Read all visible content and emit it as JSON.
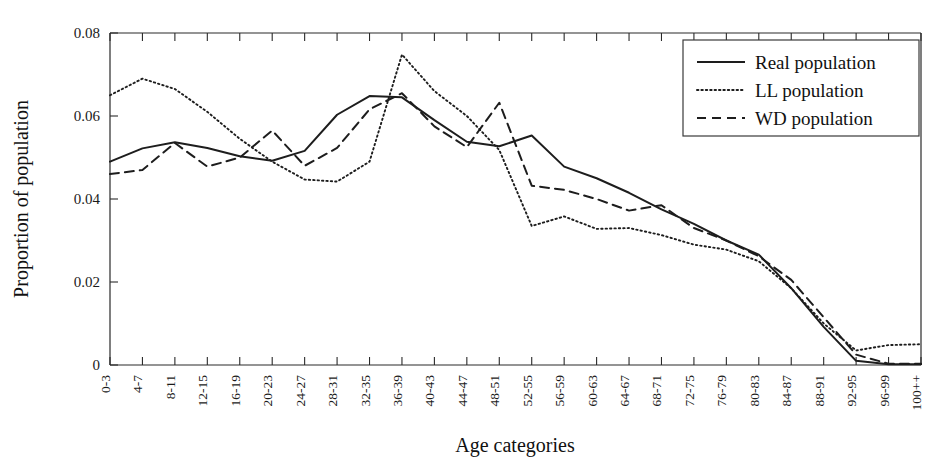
{
  "chart_data": {
    "type": "line",
    "title": "",
    "xlabel": "Age categories",
    "ylabel": "Proportion of population",
    "categories": [
      "0-3",
      "4-7",
      "8-11",
      "12-15",
      "16-19",
      "20-23",
      "24-27",
      "28-31",
      "32-35",
      "36-39",
      "40-43",
      "44-47",
      "48-51",
      "52-55",
      "56-59",
      "60-63",
      "64-67",
      "68-71",
      "72-75",
      "76-79",
      "80-83",
      "84-87",
      "88-91",
      "92-95",
      "96-99",
      "100++"
    ],
    "xlim": [
      0,
      25
    ],
    "ylim": [
      0,
      0.08
    ],
    "yticks": [
      0,
      0.02,
      0.04,
      0.06,
      0.08
    ],
    "ytick_labels": [
      "0",
      "0.02",
      "0.04",
      "0.06",
      "0.08"
    ],
    "grid": false,
    "legend_position": "top-right",
    "series": [
      {
        "name": "Real population",
        "style": "solid",
        "values": [
          0.049,
          0.0522,
          0.0537,
          0.0523,
          0.0503,
          0.0492,
          0.0516,
          0.0603,
          0.0648,
          0.0645,
          0.059,
          0.0538,
          0.0527,
          0.0553,
          0.0478,
          0.045,
          0.0415,
          0.0375,
          0.034,
          0.03,
          0.0266,
          0.0185,
          0.0092,
          0.001,
          0.0002,
          0.0002
        ]
      },
      {
        "name": "LL population",
        "style": "dotted",
        "values": [
          0.065,
          0.069,
          0.0665,
          0.061,
          0.0545,
          0.049,
          0.0447,
          0.0442,
          0.049,
          0.0748,
          0.066,
          0.06,
          0.0518,
          0.0335,
          0.0358,
          0.0328,
          0.033,
          0.0313,
          0.029,
          0.0278,
          0.025,
          0.0185,
          0.01,
          0.0035,
          0.0048,
          0.005
        ]
      },
      {
        "name": "WD population",
        "style": "dashed",
        "values": [
          0.046,
          0.047,
          0.0535,
          0.0478,
          0.05,
          0.0565,
          0.048,
          0.0523,
          0.0616,
          0.0655,
          0.0575,
          0.0525,
          0.0632,
          0.0432,
          0.0422,
          0.04,
          0.0372,
          0.0385,
          0.033,
          0.03,
          0.0262,
          0.0205,
          0.0115,
          0.0025,
          0.0003,
          0.0003
        ]
      }
    ]
  },
  "legend": {
    "items": [
      {
        "label": "Real population",
        "style": "solid"
      },
      {
        "label": "LL population",
        "style": "dotted"
      },
      {
        "label": "WD population",
        "style": "dashed"
      }
    ]
  }
}
